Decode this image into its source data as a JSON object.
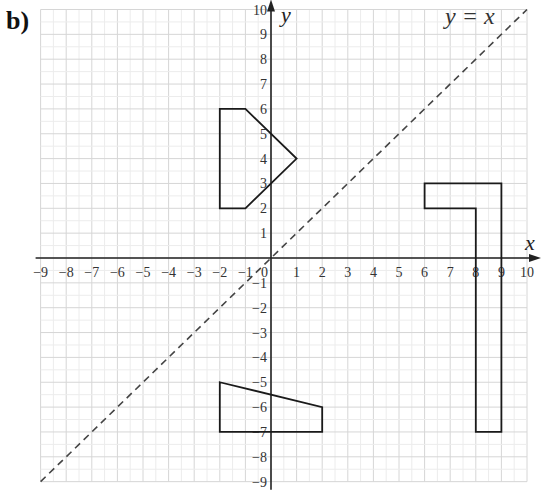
{
  "part_label": "b)",
  "axes": {
    "x_label": "x",
    "y_label": "y",
    "x_range": [
      -9,
      10
    ],
    "y_range": [
      -9,
      10
    ],
    "x_ticks": [
      "-9",
      "-8",
      "-7",
      "-6",
      "-5",
      "-4",
      "-3",
      "-2",
      "-1",
      "1",
      "2",
      "3",
      "4",
      "5",
      "6",
      "7",
      "8",
      "9",
      "10"
    ],
    "y_ticks": [
      "-9",
      "-8",
      "-7",
      "-6",
      "-5",
      "-4",
      "-3",
      "-2",
      "-1",
      "1",
      "2",
      "3",
      "4",
      "5",
      "6",
      "7",
      "8",
      "9",
      "10"
    ],
    "origin_label": "0",
    "grid": true
  },
  "line": {
    "label": "y = x",
    "style": "dashed",
    "from": [
      -9,
      -9
    ],
    "to": [
      10,
      10
    ]
  },
  "shapes": [
    {
      "name": "pentagon-upper-left",
      "points": [
        [
          -2,
          6
        ],
        [
          -1,
          6
        ],
        [
          1,
          4
        ],
        [
          -1,
          2
        ],
        [
          -2,
          2
        ]
      ]
    },
    {
      "name": "L-shape-right",
      "points": [
        [
          6,
          3
        ],
        [
          9,
          3
        ],
        [
          9,
          -7
        ],
        [
          8,
          -7
        ],
        [
          8,
          2
        ],
        [
          6,
          2
        ]
      ]
    },
    {
      "name": "trapezium-lower",
      "points": [
        [
          -2,
          -5
        ],
        [
          2,
          -6
        ],
        [
          2,
          -7
        ],
        [
          -2,
          -7
        ]
      ]
    }
  ],
  "colors": {
    "grid": "#d6d6d6",
    "axis": "#222222",
    "shape": "#1a1a1a",
    "dashed_line": "#444444"
  }
}
